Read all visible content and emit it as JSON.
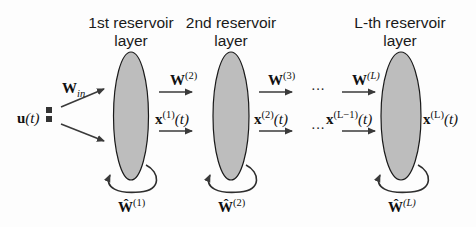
{
  "diagram": {
    "type": "deep echo state network / stacked reservoir computing architecture",
    "colors": {
      "reservoir_fill": "#bdbdbd",
      "reservoir_stroke": "#1a1a1a",
      "arrow": "#3a3a3a",
      "text": "#111111",
      "input_square": "#333333"
    },
    "input": {
      "label": "u",
      "arg": "(t)",
      "weight_label": "W",
      "weight_sub": "in"
    },
    "layers": [
      {
        "title_line1": "1st reservoir",
        "title_line2": "layer",
        "recurrent_label": "Ŵ",
        "recurrent_sup": "(1)",
        "out_state_label": "x",
        "out_state_sup": "(1)",
        "out_state_arg": "(t)",
        "next_weight_label": "W",
        "next_weight_sup": "(2)"
      },
      {
        "title_line1": "2nd reservoir",
        "title_line2": "layer",
        "recurrent_label": "Ŵ",
        "recurrent_sup": "(2)",
        "out_state_label": "x",
        "out_state_sup": "(2)",
        "out_state_arg": "(t)",
        "next_weight_label": "W",
        "next_weight_sup": "(3)"
      },
      {
        "title_line1": "L-th reservoir",
        "title_line2": "layer",
        "recurrent_label": "Ŵ",
        "recurrent_sup": "(L)",
        "in_state_label": "x",
        "in_state_sup": "(L−1)",
        "in_state_arg": "(t)",
        "in_weight_label": "W",
        "in_weight_sup": "(L)",
        "out_state_label": "x",
        "out_state_sup": "(L)",
        "out_state_arg": "(t)"
      }
    ],
    "ellipsis": "···"
  }
}
